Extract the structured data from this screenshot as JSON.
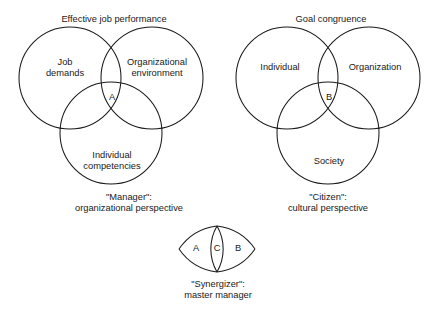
{
  "figure": {
    "background_color": "#ffffff",
    "stroke_color": "#1a1a1a"
  },
  "left_diagram": {
    "title": "Effective job performance",
    "circles": [
      {
        "key": "job-demands",
        "label": "Job\ndemands"
      },
      {
        "key": "organizational-environment",
        "label": "Organizational\nenvironment"
      },
      {
        "key": "individual-competencies",
        "label": "Individual\ncompetencies"
      }
    ],
    "labels": {
      "job_demands": "Job\ndemands",
      "organizational_environment": "Organizational\nenvironment",
      "individual_competencies": "Individual\ncompetencies"
    },
    "intersection_letter": "A",
    "caption": "\"Manager\":\norganizational perspective",
    "caption_line1": "\"Manager\":",
    "caption_line2": "organizational perspective"
  },
  "right_diagram": {
    "title": "Goal congruence",
    "circles": [
      {
        "key": "individual",
        "label": "Individual"
      },
      {
        "key": "organization",
        "label": "Organization"
      },
      {
        "key": "society",
        "label": "Society"
      }
    ],
    "labels": {
      "individual": "Individual",
      "organization": "Organization",
      "society": "Society"
    },
    "intersection_letter": "B",
    "caption": "\"Citizen\":\ncultural perspective",
    "caption_line1": "\"Citizen\":",
    "caption_line2": "cultural perspective"
  },
  "bottom_diagram": {
    "letters": {
      "left": "A",
      "center": "C",
      "right": "B"
    },
    "caption": "\"Synergizer\":\nmaster manager",
    "caption_line1": "\"Synergizer\":",
    "caption_line2": "master manager"
  }
}
